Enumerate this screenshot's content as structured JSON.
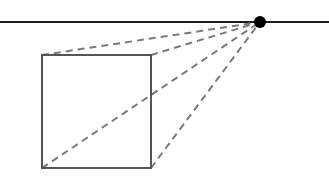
{
  "diagram": {
    "type": "one-point-perspective",
    "width": 329,
    "height": 179,
    "background": "#ffffff",
    "horizon_line": {
      "y": 22,
      "x1": 0,
      "x2": 329,
      "color": "#1a1a1a",
      "stroke_width": 2
    },
    "vanishing_point": {
      "x": 260,
      "y": 22,
      "r": 6,
      "color": "#000000"
    },
    "square": {
      "x": 42,
      "y": 55,
      "width": 109,
      "height": 113,
      "color": "#555555",
      "stroke_width": 2
    },
    "orthogonals": {
      "color": "#7a7a7a",
      "stroke_width": 2,
      "dash": "7,5",
      "lines": [
        {
          "name": "top-left",
          "x1": 42,
          "y1": 55,
          "x2": 260,
          "y2": 22
        },
        {
          "name": "top-right",
          "x1": 151,
          "y1": 55,
          "x2": 260,
          "y2": 22
        },
        {
          "name": "bottom-left",
          "x1": 42,
          "y1": 168,
          "x2": 260,
          "y2": 22
        },
        {
          "name": "bottom-right",
          "x1": 151,
          "y1": 168,
          "x2": 260,
          "y2": 22
        }
      ]
    }
  }
}
